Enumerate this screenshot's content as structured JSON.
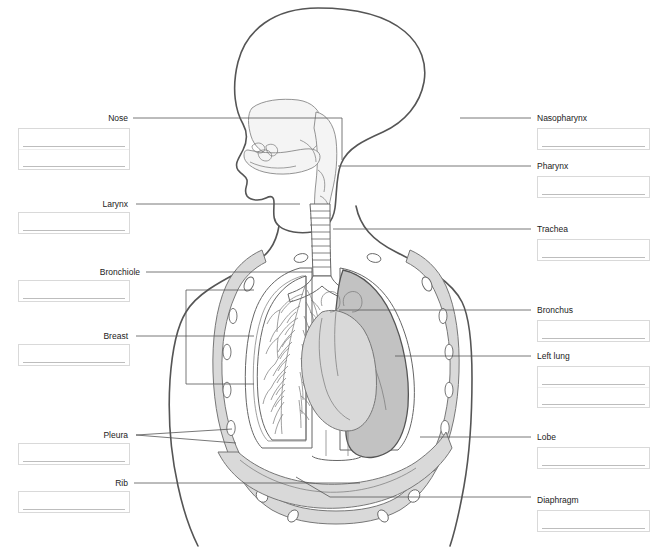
{
  "worksheet": {
    "title": "Respiratory System Labeling Diagram",
    "colors": {
      "outline": "#4a4a4a",
      "light_fill": "#f2f2f2",
      "mid_fill": "#d5d5d5",
      "dark_fill": "#bdbdbd",
      "leader_line": "#555555",
      "box_border": "#d9d9d9",
      "rule_line": "#bdbdbd",
      "label_text": "#222222",
      "background": "#ffffff"
    }
  },
  "left_labels": [
    {
      "id": "nose",
      "text": "Nose",
      "label_x": 128,
      "label_y": 113,
      "box_x": 18,
      "box_y": 128,
      "box_w": 112,
      "box_rows": 2,
      "leader": "M133,118 L342,118 L342,160"
    },
    {
      "id": "larynx",
      "text": "Larynx",
      "label_x": 128,
      "label_y": 199,
      "box_x": 18,
      "box_y": 212,
      "box_w": 112,
      "box_rows": 1,
      "leader": "M136,204 L300,204"
    },
    {
      "id": "bronchiole",
      "text": "Bronchiole",
      "label_x": 140,
      "label_y": 267,
      "box_x": 18,
      "box_y": 280,
      "box_w": 112,
      "box_rows": 1,
      "leader": "M146,272 L312,272"
    },
    {
      "id": "breast",
      "text": "Breast",
      "label_x": 128,
      "label_y": 331,
      "box_x": 18,
      "box_y": 344,
      "box_w": 112,
      "box_rows": 1,
      "leader": "M136,336 L186,336"
    },
    {
      "id": "pleura",
      "text": "Pleura",
      "label_x": 128,
      "label_y": 430,
      "box_x": 18,
      "box_y": 443,
      "box_w": 112,
      "box_rows": 1,
      "leader": "M136,435 L232,429 M136,435 L236,443"
    },
    {
      "id": "rib",
      "text": "Rib",
      "label_x": 128,
      "label_y": 478,
      "box_x": 18,
      "box_y": 491,
      "box_w": 112,
      "box_rows": 1,
      "leader": "M134,483 L360,483"
    }
  ],
  "right_labels": [
    {
      "id": "nasopharynx",
      "text": "Nasopharynx",
      "label_x": 537,
      "label_y": 113,
      "box_x": 537,
      "box_y": 128,
      "box_w": 113,
      "box_rows": 1,
      "leader": "M460,118 L531,118"
    },
    {
      "id": "pharynx",
      "text": "Pharynx",
      "label_x": 537,
      "label_y": 161,
      "box_x": 537,
      "box_y": 176,
      "box_w": 113,
      "box_rows": 1,
      "leader": "M338,166 L531,166"
    },
    {
      "id": "trachea",
      "text": "Trachea",
      "label_x": 537,
      "label_y": 224,
      "box_x": 537,
      "box_y": 239,
      "box_w": 113,
      "box_rows": 1,
      "leader": "M333,229 L531,229"
    },
    {
      "id": "bronchus",
      "text": "Bronchus",
      "label_x": 537,
      "label_y": 305,
      "box_x": 537,
      "box_y": 320,
      "box_w": 113,
      "box_rows": 1,
      "leader": "M339,310 L531,310"
    },
    {
      "id": "left_lung",
      "text": "Left lung",
      "label_x": 537,
      "label_y": 351,
      "box_x": 537,
      "box_y": 366,
      "box_w": 113,
      "box_rows": 2,
      "leader": "M395,356 L531,356"
    },
    {
      "id": "lobe",
      "text": "Lobe",
      "label_x": 537,
      "label_y": 432,
      "box_x": 537,
      "box_y": 447,
      "box_w": 113,
      "box_rows": 1,
      "leader": "M420,437 L531,437"
    },
    {
      "id": "diaphragm",
      "text": "Diaphragm",
      "label_x": 537,
      "label_y": 495,
      "box_x": 537,
      "box_y": 510,
      "box_w": 113,
      "box_rows": 1,
      "leader": "M296,477 L330,497 L531,497"
    }
  ],
  "anatomy": {
    "parts": [
      {
        "name": "head-profile"
      },
      {
        "name": "nasal-cavity"
      },
      {
        "name": "oral-cavity"
      },
      {
        "name": "pharynx-passage"
      },
      {
        "name": "trachea-rings"
      },
      {
        "name": "rib-cage"
      },
      {
        "name": "right-lung-bronchial-tree"
      },
      {
        "name": "left-lung-shaded"
      },
      {
        "name": "heart"
      },
      {
        "name": "diaphragm-dome"
      },
      {
        "name": "breast-bracket"
      }
    ]
  }
}
